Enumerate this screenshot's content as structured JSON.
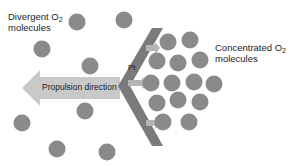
{
  "labels": {
    "divergent_line1": "Divergent O",
    "divergent_sub": "2",
    "divergent_line2": "molecules",
    "concentrated_line1": "Concentrated O",
    "concentrated_sub": "2",
    "concentrated_line2": "molecules",
    "catalyst": "Pt",
    "propulsion": "Propulsion direction"
  },
  "colors": {
    "molecule": "#8a8a8a",
    "chevron": "#7a7a7a",
    "arrow": "#c9c9c9",
    "small_arrow": "#b5b5b5",
    "text": "#222222"
  },
  "divergent_molecules": [
    {
      "cx": 77,
      "cy": 22
    },
    {
      "cx": 124,
      "cy": 20
    },
    {
      "cx": 42,
      "cy": 49
    },
    {
      "cx": 90,
      "cy": 66
    },
    {
      "cx": 85,
      "cy": 111
    },
    {
      "cx": 22,
      "cy": 123
    },
    {
      "cx": 57,
      "cy": 149
    },
    {
      "cx": 107,
      "cy": 152
    }
  ],
  "concentrated_molecules": [
    {
      "cx": 168,
      "cy": 42
    },
    {
      "cx": 190,
      "cy": 40
    },
    {
      "cx": 157,
      "cy": 61
    },
    {
      "cx": 178,
      "cy": 63
    },
    {
      "cx": 200,
      "cy": 60
    },
    {
      "cx": 151,
      "cy": 83
    },
    {
      "cx": 172,
      "cy": 83
    },
    {
      "cx": 194,
      "cy": 82
    },
    {
      "cx": 214,
      "cy": 84
    },
    {
      "cx": 157,
      "cy": 103
    },
    {
      "cx": 178,
      "cy": 100
    },
    {
      "cx": 200,
      "cy": 102
    },
    {
      "cx": 163,
      "cy": 122
    },
    {
      "cx": 189,
      "cy": 122
    }
  ]
}
